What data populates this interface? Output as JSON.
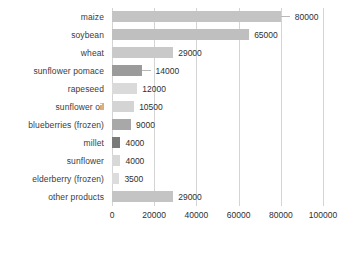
{
  "chart_data": {
    "type": "bar",
    "orientation": "horizontal",
    "title": "",
    "xlabel": "",
    "ylabel": "",
    "xlim": [
      0,
      100000
    ],
    "grid": true,
    "legend": "none",
    "xticks": [
      0,
      20000,
      40000,
      60000,
      80000,
      100000
    ],
    "xtick_labels": [
      "0",
      "20000",
      "40000",
      "60000",
      "80000",
      "100000"
    ],
    "categories": [
      "maize",
      "soybean",
      "wheat",
      "sunflower pomace",
      "rapeseed",
      "sunflower oil",
      "blueberries (frozen)",
      "millet",
      "sunflower",
      "elderberry (frozen)",
      "other products"
    ],
    "values": [
      80000,
      65000,
      29000,
      14000,
      12000,
      10500,
      9000,
      4000,
      4000,
      3500,
      29000
    ],
    "value_labels": [
      "80000",
      "65000",
      "29000",
      "14000",
      "12000",
      "10500",
      "9000",
      "4000",
      "4000",
      "3500",
      "29000"
    ],
    "bar_colors": [
      "#c4c4c4",
      "#bfbfbf",
      "#c9c9c9",
      "#9b9b9b",
      "#dadada",
      "#d4d4d4",
      "#a8a8a8",
      "#7a7a7a",
      "#d8d8d8",
      "#dcdcdc",
      "#c4c4c4"
    ],
    "leader_lines": [
      true,
      false,
      false,
      true,
      false,
      false,
      false,
      false,
      false,
      false,
      false
    ],
    "gridline_color": "#d4d4d4",
    "label_color": "#3b3b3b",
    "value_color": "#2f2f2f",
    "background": "#ffffff"
  }
}
